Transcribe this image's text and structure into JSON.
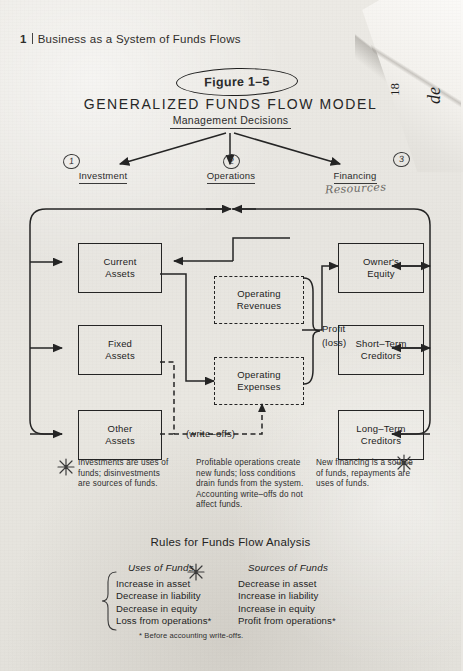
{
  "page": {
    "chapter_number": "1",
    "chapter_title": "Business as a System of Funds Flows"
  },
  "figure": {
    "badge": "Figure 1–5",
    "title": "GENERALIZED  FUNDS  FLOW  MODEL",
    "subtitle": "Management Decisions"
  },
  "branches": [
    {
      "marker": "1",
      "label": "Investment",
      "handwritten": ""
    },
    {
      "marker": "2",
      "label": "Operations",
      "handwritten": ""
    },
    {
      "marker": "3",
      "label": "Financing",
      "handwritten": "Resources"
    }
  ],
  "diagram": {
    "left_boxes": [
      {
        "line1": "Current",
        "line2": "Assets"
      },
      {
        "line1": "Fixed",
        "line2": "Assets"
      },
      {
        "line1": "Other",
        "line2": "Assets"
      }
    ],
    "center_boxes": [
      {
        "line1": "Operating",
        "line2": "Revenues",
        "style": "dashed"
      },
      {
        "line1": "Operating",
        "line2": "Expenses",
        "style": "dashed"
      }
    ],
    "right_boxes": [
      {
        "line1": "Owner's",
        "line2": "Equity"
      },
      {
        "line1": "Short–Term",
        "line2": "Creditors"
      },
      {
        "line1": "Long–Term",
        "line2": "Creditors"
      }
    ],
    "brace_label_1": "Profit",
    "brace_label_2": "(loss)",
    "writeoffs_label": "(write–offs)"
  },
  "annotations": [
    {
      "marker": "asterisk",
      "text": "Investments are uses of funds; disinvestments are sources of funds."
    },
    {
      "marker": "none",
      "text": "Profitable operations create new funds; loss conditions drain funds from the system. Accounting write–offs do not affect funds."
    },
    {
      "marker": "asterisk",
      "text": "New financing is a source of funds, repayments are uses of funds."
    }
  ],
  "rules": {
    "title": "Rules for Funds Flow Analysis",
    "uses_heading": "Uses of Funds",
    "sources_heading": "Sources of Funds",
    "uses": [
      "Increase in asset",
      "Decrease in liability",
      "Decrease in equity",
      "Loss from operations*"
    ],
    "sources": [
      "Decrease in asset",
      "Increase in liability",
      "Increase in equity",
      "Profit from operations*"
    ],
    "footnote": "* Before accounting write-offs."
  },
  "folded_corner": {
    "text_number": "18",
    "text_partial": "de"
  },
  "colors": {
    "paper": "#e9e7e2",
    "ink": "#242424",
    "pencil": "#6c6a66"
  }
}
